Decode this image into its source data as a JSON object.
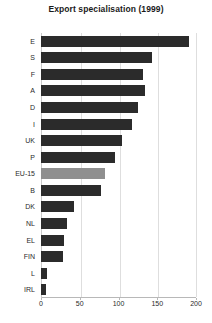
{
  "chart_data": {
    "type": "bar",
    "orientation": "horizontal",
    "title": "Export specialisation (1999)",
    "xlabel": "",
    "ylabel": "",
    "categories": [
      "E",
      "S",
      "F",
      "A",
      "D",
      "I",
      "UK",
      "P",
      "EU-15",
      "B",
      "DK",
      "NL",
      "EL",
      "FIN",
      "L",
      "IRL"
    ],
    "values": [
      191,
      143,
      131,
      134,
      125,
      118,
      105,
      96,
      83,
      77,
      43,
      33,
      30,
      28,
      8,
      6
    ],
    "highlight_category": "EU-15",
    "xlim": [
      0,
      200
    ],
    "xticks": [
      0,
      50,
      100,
      150,
      200
    ],
    "xtick_labels": [
      "0",
      "50",
      "100",
      "150",
      "200"
    ],
    "grid": true,
    "grid_axis": "x",
    "legend": null,
    "bar_color": "#2b2b2b",
    "highlight_color": "#8f8f8f"
  }
}
